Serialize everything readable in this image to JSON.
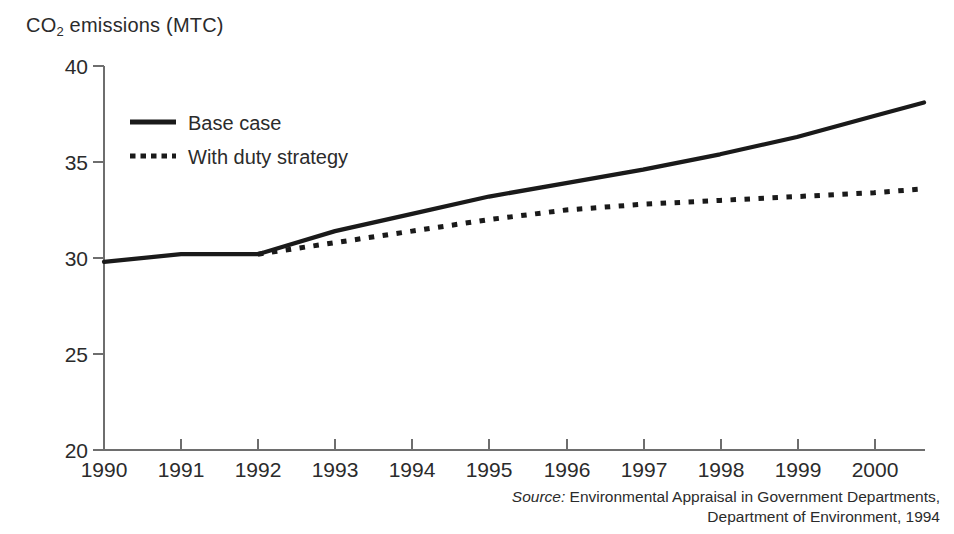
{
  "chart_data": {
    "type": "line",
    "title": "CO2 emissions (MTC)",
    "ylabel": "CO2 emissions (MTC)",
    "xlabel": "",
    "grid": false,
    "legend_position": "upper-left-inside",
    "xlim": [
      1990,
      2000.65
    ],
    "ylim": [
      20,
      40
    ],
    "yticks": [
      20,
      25,
      30,
      35,
      40
    ],
    "categories": [
      1990,
      1991,
      1992,
      1993,
      1994,
      1995,
      1996,
      1997,
      1998,
      1999,
      2000,
      2000.65
    ],
    "series": [
      {
        "name": "Base case",
        "style": "solid",
        "color": "#1a1a1a",
        "values": [
          29.8,
          30.2,
          30.2,
          31.4,
          32.3,
          33.2,
          33.9,
          34.6,
          35.4,
          36.3,
          37.4,
          38.1
        ]
      },
      {
        "name": "With duty strategy",
        "style": "dotted",
        "color": "#1a1a1a",
        "values": [
          null,
          null,
          30.2,
          30.8,
          31.4,
          32.0,
          32.5,
          32.8,
          33.0,
          33.2,
          33.4,
          33.6
        ]
      }
    ],
    "xtick_labels": [
      "1990",
      "1991",
      "1992",
      "1993",
      "1994",
      "1995",
      "1996",
      "1997",
      "1998",
      "1999",
      "2000"
    ],
    "ytick_labels": [
      "20",
      "25",
      "30",
      "35",
      "40"
    ]
  },
  "title": {
    "prefix": "CO",
    "subscript": "2",
    "suffix": " emissions (MTC)"
  },
  "legend": {
    "items": [
      {
        "label": "Base case",
        "style": "solid"
      },
      {
        "label": "With duty strategy",
        "style": "dotted"
      }
    ]
  },
  "source": {
    "label": "Source:",
    "line1": " Environmental Appraisal in Government Departments,",
    "line2": "Department of Environment, 1994"
  },
  "colors": {
    "ink": "#1a1a1a",
    "axis": "#6e6e6e",
    "background": "#ffffff"
  }
}
